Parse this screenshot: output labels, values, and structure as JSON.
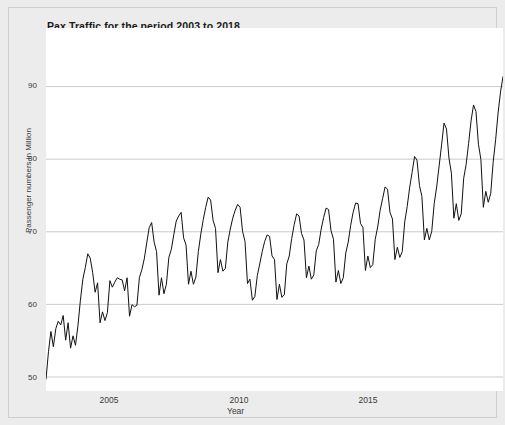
{
  "figure": {
    "title": "Pax Traffic for the period 2003 to 2018",
    "background_color": "#ececec",
    "panel_color": "#ffffff",
    "line_color": "#111111",
    "grid_color": "#cccccc"
  },
  "axes": {
    "xlabel": "Year",
    "ylabel": "Passenger numbers in Million",
    "xticks": [
      "2005",
      "2010",
      "2015"
    ],
    "yticks": [
      "50",
      "60",
      "70",
      "80",
      "90"
    ]
  },
  "chart_data": {
    "type": "line",
    "title": "Pax Traffic for the period 2003 to 2018",
    "xlabel": "Year",
    "ylabel": "Passenger numbers in Million",
    "xlim": [
      2003.0,
      2018.5
    ],
    "ylim": [
      48.0,
      98.0
    ],
    "xticks": [
      2005,
      2010,
      2015
    ],
    "yticks": [
      50,
      60,
      70,
      80,
      90
    ],
    "grid": true,
    "legend": null,
    "frequency": "monthly",
    "x_start": 2003.0,
    "x_step": 0.0833333,
    "series": [
      {
        "name": "Pax Traffic",
        "values": [
          49.6,
          53.4,
          56.2,
          54.1,
          56.6,
          57.6,
          57.1,
          58.4,
          55.0,
          57.4,
          53.9,
          55.6,
          54.3,
          57.0,
          60.5,
          63.4,
          65.0,
          66.9,
          66.3,
          64.3,
          61.6,
          62.9,
          57.4,
          58.9,
          57.7,
          58.8,
          63.2,
          62.3,
          63.0,
          63.6,
          63.4,
          63.3,
          61.8,
          63.6,
          58.3,
          59.9,
          59.6,
          59.8,
          63.6,
          64.7,
          66.2,
          68.4,
          70.5,
          71.2,
          68.5,
          67.2,
          61.2,
          63.6,
          61.4,
          62.7,
          66.4,
          67.5,
          69.5,
          71.4,
          72.1,
          72.6,
          69.1,
          68.1,
          62.7,
          64.5,
          62.7,
          63.7,
          67.2,
          69.6,
          71.6,
          73.3,
          74.7,
          74.3,
          71.5,
          70.4,
          64.3,
          66.1,
          64.5,
          64.9,
          68.5,
          70.3,
          71.8,
          72.9,
          73.7,
          73.3,
          70.0,
          68.6,
          62.8,
          63.4,
          60.5,
          61.0,
          63.9,
          65.5,
          67.2,
          68.6,
          69.5,
          69.3,
          66.6,
          66.1,
          60.6,
          62.7,
          60.9,
          61.3,
          65.5,
          66.6,
          69.0,
          70.9,
          72.4,
          72.1,
          69.7,
          68.8,
          63.6,
          65.2,
          63.4,
          64.0,
          67.3,
          68.2,
          70.3,
          71.9,
          73.2,
          73.0,
          70.1,
          68.9,
          63.0,
          64.6,
          62.8,
          63.6,
          67.0,
          68.5,
          70.8,
          72.6,
          73.9,
          73.8,
          71.1,
          70.5,
          64.6,
          66.6,
          65.0,
          65.4,
          68.9,
          70.6,
          72.9,
          74.5,
          76.1,
          75.8,
          72.6,
          71.7,
          66.1,
          67.8,
          66.4,
          67.2,
          71.3,
          73.4,
          76.0,
          78.1,
          80.3,
          79.8,
          76.3,
          74.8,
          68.8,
          70.4,
          68.8,
          70.0,
          73.8,
          76.1,
          79.0,
          81.9,
          84.9,
          84.1,
          80.1,
          78.0,
          71.8,
          73.8,
          71.5,
          72.4,
          77.3,
          79.2,
          82.1,
          85.2,
          87.4,
          86.5,
          82.0,
          79.9,
          73.3,
          75.5,
          74.0,
          75.2,
          79.5,
          82.6,
          86.3,
          89.2,
          91.3,
          90.6,
          86.3,
          84.2,
          76.7,
          79.4,
          77.0,
          78.6,
          83.0,
          85.8,
          89.4,
          93.5,
          96.5,
          95.3,
          90.0,
          87.4,
          80.5,
          83.1,
          81.0,
          82.5,
          83.2
        ]
      }
    ]
  }
}
